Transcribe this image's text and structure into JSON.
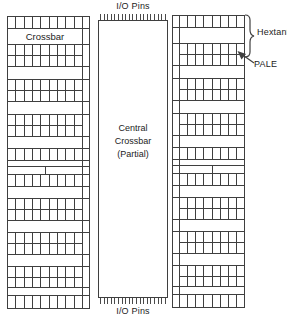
{
  "io_pins": {
    "top_label": "I/O Pins",
    "bottom_label": "I/O Pins"
  },
  "central_block": {
    "label_lines": [
      "Central",
      "Crossbar",
      "(Partial)"
    ]
  },
  "annotations": {
    "hextant_label": "Hextant",
    "pale_label": "PALE"
  },
  "colors": {
    "line": "#3f3f3f",
    "background": "#ffffff",
    "text": "#1c1c1c"
  },
  "left_column": {
    "label": "Crossbar",
    "cells_per_row": 9,
    "rail_side": "right",
    "bands": [
      {
        "type": "grid",
        "rows": 1,
        "h": 12
      },
      {
        "type": "label",
        "h": 16
      },
      {
        "type": "grid",
        "rows": 2,
        "h": 22
      },
      {
        "type": "blank",
        "h": 13
      },
      {
        "type": "grid",
        "rows": 2,
        "h": 22
      },
      {
        "type": "blank",
        "h": 13
      },
      {
        "type": "grid",
        "rows": 2,
        "h": 22
      },
      {
        "type": "blank",
        "h": 12
      },
      {
        "type": "grid",
        "rows": 1,
        "h": 12
      },
      {
        "type": "blank",
        "h": 6
      },
      {
        "type": "split",
        "h": 8
      },
      {
        "type": "grid",
        "rows": 1,
        "h": 12
      },
      {
        "type": "blank",
        "h": 12
      },
      {
        "type": "grid",
        "rows": 2,
        "h": 22
      },
      {
        "type": "blank",
        "h": 12
      },
      {
        "type": "grid",
        "rows": 2,
        "h": 22
      },
      {
        "type": "blank",
        "h": 12
      },
      {
        "type": "grid",
        "rows": 2,
        "h": 21
      },
      {
        "type": "blank",
        "h": 8
      },
      {
        "type": "grid",
        "rows": 1,
        "h": 12
      }
    ]
  },
  "right_column": {
    "label": "",
    "cells_per_row": 8,
    "rail_side": "left",
    "bands": [
      {
        "type": "grid",
        "rows": 1,
        "h": 12
      },
      {
        "type": "blank",
        "h": 16
      },
      {
        "type": "grid",
        "rows": 2,
        "h": 22
      },
      {
        "type": "blank",
        "h": 13
      },
      {
        "type": "grid",
        "rows": 2,
        "h": 22
      },
      {
        "type": "blank",
        "h": 13
      },
      {
        "type": "grid",
        "rows": 2,
        "h": 22
      },
      {
        "type": "blank",
        "h": 12
      },
      {
        "type": "grid",
        "rows": 1,
        "h": 12
      },
      {
        "type": "blank",
        "h": 6
      },
      {
        "type": "split",
        "h": 8
      },
      {
        "type": "grid",
        "rows": 1,
        "h": 12
      },
      {
        "type": "blank",
        "h": 12
      },
      {
        "type": "grid",
        "rows": 2,
        "h": 22
      },
      {
        "type": "blank",
        "h": 12
      },
      {
        "type": "grid",
        "rows": 2,
        "h": 22
      },
      {
        "type": "blank",
        "h": 12
      },
      {
        "type": "grid",
        "rows": 2,
        "h": 21
      },
      {
        "type": "blank",
        "h": 8
      },
      {
        "type": "grid",
        "rows": 1,
        "h": 12
      }
    ]
  }
}
